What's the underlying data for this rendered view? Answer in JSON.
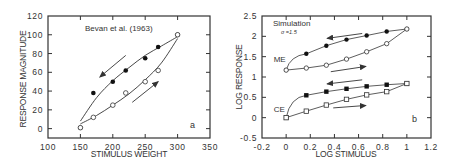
{
  "chart_data": [
    {
      "panel": "a",
      "type": "scatter",
      "title": "",
      "annotation": "Bevan et al. (1963)",
      "panel_label": "a",
      "xlabel": "STIMULUS WEIGHT",
      "ylabel": "RESPONSE MAGNITUDE",
      "xlim": [
        100,
        350
      ],
      "ylim": [
        -10,
        120
      ],
      "xticks": [
        100,
        150,
        200,
        250,
        300,
        350
      ],
      "yticks": [
        0,
        20,
        40,
        60,
        80,
        100,
        120
      ],
      "grid": false,
      "legend": "none",
      "series": [
        {
          "name": "Descending (filled circles)",
          "marker": "filled-circle",
          "x": [
            150,
            170,
            200,
            220,
            250,
            270,
            300
          ],
          "values": [
            1,
            38,
            50,
            62,
            75,
            87,
            100
          ]
        },
        {
          "name": "Ascending (open circles)",
          "marker": "open-circle",
          "x": [
            150,
            170,
            200,
            220,
            250,
            270,
            300
          ],
          "values": [
            1,
            12,
            25,
            38,
            50,
            62,
            100
          ]
        }
      ],
      "curves": [
        {
          "name": "upper fit",
          "x": [
            150,
            175,
            200,
            225,
            250,
            275,
            300
          ],
          "values": [
            8,
            33,
            51,
            65,
            78,
            88,
            98
          ]
        },
        {
          "name": "lower fit",
          "x": [
            150,
            175,
            200,
            225,
            250,
            275,
            300
          ],
          "values": [
            5,
            14,
            25,
            37,
            52,
            70,
            96
          ]
        }
      ],
      "arrows": [
        {
          "direction": "down-left",
          "from": [
            220,
            78
          ],
          "to": [
            180,
            55
          ]
        },
        {
          "direction": "up-right",
          "from": [
            230,
            28
          ],
          "to": [
            270,
            50
          ]
        }
      ]
    },
    {
      "panel": "b",
      "type": "line",
      "title": "",
      "annotation": "Simulation",
      "sub_annotation": "σ =1.5",
      "panel_label": "b",
      "xlabel": "LOG STIMULUS",
      "ylabel": "LOG RESPONSE",
      "xlim": [
        -0.2,
        1.2
      ],
      "ylim": [
        -0.5,
        2.5
      ],
      "xticks": [
        -0.2,
        0,
        0.2,
        0.4,
        0.6,
        0.8,
        1,
        1.2
      ],
      "yticks": [
        -0.5,
        0,
        0.5,
        1,
        1.5,
        2,
        2.5
      ],
      "grid": false,
      "legend": "none",
      "group_labels": [
        {
          "text": "ME",
          "x": -0.07,
          "y": 1.45
        },
        {
          "text": "CE",
          "x": -0.07,
          "y": 0.22
        }
      ],
      "series": [
        {
          "name": "ME descending",
          "marker": "filled-circle",
          "x": [
            0,
            0.167,
            0.333,
            0.5,
            0.667,
            0.833,
            1
          ],
          "values": [
            1.17,
            1.57,
            1.77,
            1.92,
            2.02,
            2.12,
            2.18
          ]
        },
        {
          "name": "ME ascending",
          "marker": "open-circle",
          "x": [
            0,
            0.167,
            0.333,
            0.5,
            0.667,
            0.833,
            1
          ],
          "values": [
            1.17,
            1.22,
            1.29,
            1.44,
            1.62,
            1.82,
            2.18
          ]
        },
        {
          "name": "CE descending",
          "marker": "filled-square",
          "x": [
            0,
            0.167,
            0.333,
            0.5,
            0.667,
            0.833,
            1
          ],
          "values": [
            0,
            0.55,
            0.64,
            0.71,
            0.77,
            0.81,
            0.84
          ]
        },
        {
          "name": "CE ascending",
          "marker": "open-square",
          "x": [
            0,
            0.167,
            0.333,
            0.5,
            0.667,
            0.833,
            1
          ],
          "values": [
            0,
            0.16,
            0.31,
            0.45,
            0.56,
            0.64,
            0.84
          ]
        }
      ],
      "arrows": [
        {
          "direction": "left",
          "from": [
            0.63,
            2.07
          ],
          "to": [
            0.34,
            1.95
          ]
        },
        {
          "direction": "right",
          "from": [
            0.37,
            1.13
          ],
          "to": [
            0.66,
            1.26
          ]
        },
        {
          "direction": "left",
          "from": [
            0.63,
            0.93
          ],
          "to": [
            0.34,
            0.83
          ]
        },
        {
          "direction": "right",
          "from": [
            0.39,
            0.24
          ],
          "to": [
            0.66,
            0.3
          ]
        }
      ]
    }
  ]
}
